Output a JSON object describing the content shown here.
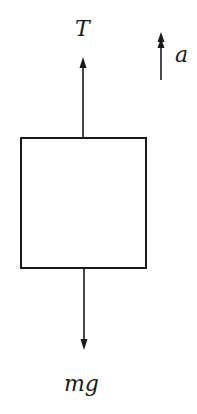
{
  "diagram": {
    "type": "free-body diagram",
    "object": "block",
    "forces": [
      {
        "label": "T",
        "direction": "up",
        "meaning": "tension"
      },
      {
        "label": "mg",
        "direction": "down",
        "meaning": "weight"
      }
    ],
    "acceleration": {
      "label": "a",
      "direction": "up"
    }
  },
  "labels": {
    "tension": "T",
    "acceleration": "a",
    "weight": "mg"
  },
  "colors": {
    "stroke": "#1a1a1a",
    "background": "#ffffff"
  }
}
